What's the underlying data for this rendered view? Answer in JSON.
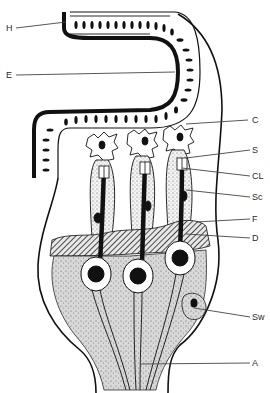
{
  "figure": {
    "labels": {
      "H": "H",
      "E": "E",
      "C": "C",
      "S": "S",
      "CL": "CL",
      "Sc": "Sc",
      "F": "F",
      "D": "D",
      "Sw": "Sw",
      "A": "A"
    },
    "colors": {
      "ink": "#111111",
      "stipple": "#cfcfcf",
      "background": "#ffffff"
    }
  }
}
